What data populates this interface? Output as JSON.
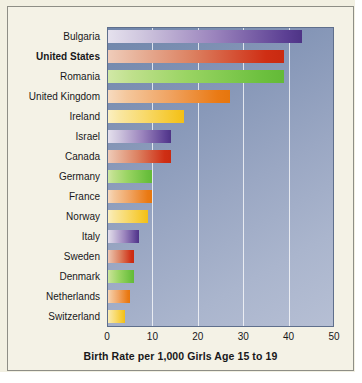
{
  "chart_data": {
    "type": "bar",
    "orientation": "horizontal",
    "title": "",
    "xlabel": "Birth Rate per 1,000 Girls Age 15 to 19",
    "ylabel": "",
    "xlim": [
      0,
      50
    ],
    "xticks": [
      0,
      10,
      20,
      30,
      40,
      50
    ],
    "xtick_labels": [
      "0",
      "10",
      "20",
      "30",
      "40",
      "50"
    ],
    "grid": "vertical gridlines at 10, 20, 30, 40",
    "legend": "none",
    "highlighted_category": "United States",
    "categories": [
      "Bulgaria",
      "United States",
      "Romania",
      "United Kingdom",
      "Ireland",
      "Israel",
      "Canada",
      "Germany",
      "France",
      "Norway",
      "Italy",
      "Sweden",
      "Denmark",
      "Netherlands",
      "Switzerland"
    ],
    "values": [
      43,
      39,
      39,
      27,
      17,
      14,
      14,
      10,
      10,
      9,
      7,
      6,
      6,
      5,
      4
    ],
    "bar_colors": [
      "purple",
      "red",
      "green",
      "orange",
      "yellow",
      "purple",
      "red",
      "green",
      "orange",
      "yellow",
      "purple",
      "red",
      "green",
      "orange",
      "yellow"
    ],
    "bars": [
      {
        "label": "Bulgaria",
        "value": 43,
        "color": "purple",
        "bold": false
      },
      {
        "label": "United States",
        "value": 39,
        "color": "red",
        "bold": true
      },
      {
        "label": "Romania",
        "value": 39,
        "color": "green",
        "bold": false
      },
      {
        "label": "United Kingdom",
        "value": 27,
        "color": "orange",
        "bold": false
      },
      {
        "label": "Ireland",
        "value": 17,
        "color": "yellow",
        "bold": false
      },
      {
        "label": "Israel",
        "value": 14,
        "color": "purple",
        "bold": false
      },
      {
        "label": "Canada",
        "value": 14,
        "color": "red",
        "bold": false
      },
      {
        "label": "Germany",
        "value": 10,
        "color": "green",
        "bold": false
      },
      {
        "label": "France",
        "value": 10,
        "color": "orange",
        "bold": false
      },
      {
        "label": "Norway",
        "value": 9,
        "color": "yellow",
        "bold": false
      },
      {
        "label": "Italy",
        "value": 7,
        "color": "purple",
        "bold": false
      },
      {
        "label": "Sweden",
        "value": 6,
        "color": "red",
        "bold": false
      },
      {
        "label": "Denmark",
        "value": 6,
        "color": "green",
        "bold": false
      },
      {
        "label": "Netherlands",
        "value": 5,
        "color": "orange",
        "bold": false
      },
      {
        "label": "Switzerland",
        "value": 4,
        "color": "yellow",
        "bold": false
      }
    ],
    "colors": {
      "figure_background": "#f4f2e6",
      "plot_background_top": "#6f86ab",
      "plot_background_bottom": "#b6bfd4",
      "gridline": "#ffffff",
      "frame_border": "#8e8e86",
      "plot_border": "#5f6f8c",
      "text": "#18181a",
      "purple": "#5b3f93",
      "red": "#cf2e14",
      "green": "#6cc03e",
      "orange": "#ea7a14",
      "yellow": "#f5c524"
    }
  }
}
